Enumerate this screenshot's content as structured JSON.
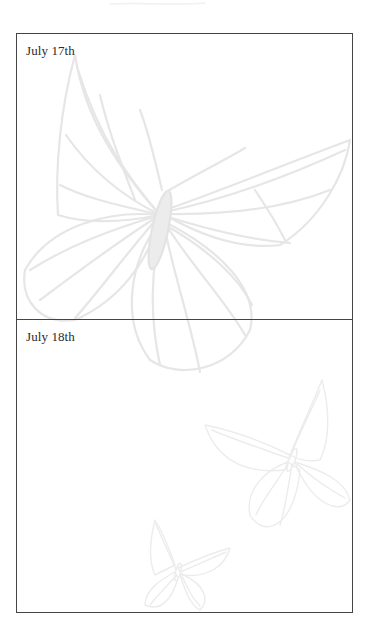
{
  "page": {
    "background": "#ffffff",
    "border_color": "#454545",
    "art_color": "#e6e6e6"
  },
  "entries": [
    {
      "label": "July 17th"
    },
    {
      "label": "July 18th"
    }
  ],
  "decorations": {
    "icons": [
      "large-butterfly-illustration",
      "medium-butterfly-illustration",
      "small-butterfly-illustration"
    ]
  }
}
